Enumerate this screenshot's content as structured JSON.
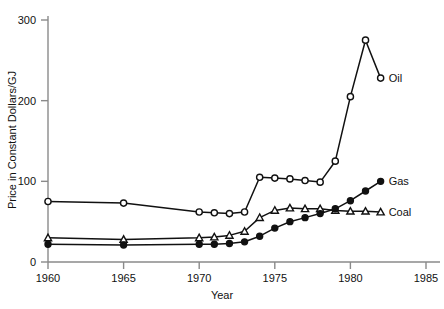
{
  "chart_data": {
    "type": "line",
    "title": "",
    "xlabel": "Year",
    "ylabel": "Price in Constant Dollars/GJ",
    "xlim": [
      1960,
      1985
    ],
    "ylim": [
      0,
      300
    ],
    "xticks": [
      1960,
      1965,
      1970,
      1975,
      1980,
      1985
    ],
    "xtick_labels": [
      "1960",
      "1965",
      "1970",
      "1975",
      "1980",
      "1985"
    ],
    "yticks": [
      0,
      100,
      200,
      300
    ],
    "ytick_labels": [
      "0",
      "100",
      "200",
      "300"
    ],
    "grid": false,
    "legend_position": "right-inline-labels",
    "series": [
      {
        "name": "Oil",
        "marker": "open-circle",
        "label": "Oil",
        "x": [
          1960,
          1965,
          1970,
          1971,
          1972,
          1973,
          1974,
          1975,
          1976,
          1977,
          1978,
          1979,
          1980,
          1981,
          1982
        ],
        "values": [
          75,
          73,
          62,
          61,
          60,
          62,
          105,
          104,
          103,
          101,
          99,
          125,
          205,
          275,
          228
        ]
      },
      {
        "name": "Coal",
        "marker": "open-triangle",
        "label": "Coal",
        "x": [
          1960,
          1965,
          1970,
          1971,
          1972,
          1973,
          1974,
          1975,
          1976,
          1977,
          1978,
          1979,
          1980,
          1981,
          1982
        ],
        "values": [
          30,
          28,
          30,
          31,
          33,
          38,
          55,
          64,
          67,
          66,
          66,
          64,
          63,
          63,
          62
        ]
      },
      {
        "name": "Gas",
        "marker": "filled-circle",
        "label": "Gas",
        "x": [
          1960,
          1965,
          1970,
          1971,
          1972,
          1973,
          1974,
          1975,
          1976,
          1977,
          1978,
          1979,
          1980,
          1981,
          1982
        ],
        "values": [
          22,
          21,
          22,
          22,
          23,
          25,
          32,
          42,
          50,
          55,
          60,
          66,
          76,
          88,
          100
        ]
      }
    ]
  },
  "axes": {
    "x_title": "Year",
    "y_title": "Price in Constant Dollars/GJ"
  }
}
